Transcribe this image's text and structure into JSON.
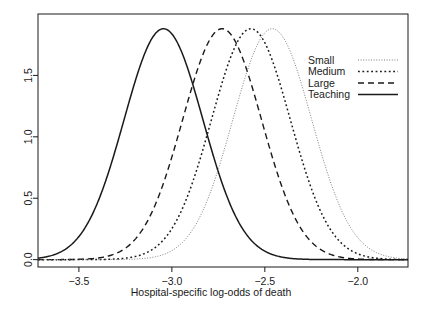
{
  "chart_data": {
    "type": "line",
    "title": "",
    "xlabel": "Hospital-specific log-odds of death",
    "ylabel": "",
    "xlim": [
      -3.72,
      -1.73
    ],
    "ylim": [
      -0.06,
      2.0
    ],
    "xticks": [
      -3.5,
      -3.0,
      -2.5,
      -2.0
    ],
    "xtick_labels": [
      "-3.5",
      "-3.0",
      "-2.5",
      "-2.0"
    ],
    "yticks": [
      0.0,
      0.5,
      1.0,
      1.5
    ],
    "ytick_labels": [
      "0.0",
      "0.5",
      "1.0",
      "1.5"
    ],
    "grid": false,
    "legend_position": "top-right",
    "frame": true,
    "series": [
      {
        "name": "Small",
        "label": "Small",
        "linestyle": "fine-dotted",
        "dash": "1,1.6",
        "width": 0.9,
        "color": "#6f6f6f",
        "mean": -2.46,
        "sd": 0.212,
        "peak": 1.88
      },
      {
        "name": "Medium",
        "label": "Medium",
        "linestyle": "dotted",
        "dash": "1.8,2.6",
        "width": 1.5,
        "color": "#1a1a1a",
        "mean": -2.575,
        "sd": 0.212,
        "peak": 1.88
      },
      {
        "name": "Large",
        "label": "Large",
        "linestyle": "dashed",
        "dash": "6,4",
        "width": 1.4,
        "color": "#1a1a1a",
        "mean": -2.73,
        "sd": 0.212,
        "peak": 1.88
      },
      {
        "name": "Teaching",
        "label": "Teaching",
        "linestyle": "solid",
        "dash": "none",
        "width": 1.5,
        "color": "#1a1a1a",
        "mean": -3.045,
        "sd": 0.212,
        "peak": 1.88
      }
    ]
  },
  "legend": {
    "entries": [
      {
        "label": "Small"
      },
      {
        "label": "Medium"
      },
      {
        "label": "Large"
      },
      {
        "label": "Teaching"
      }
    ]
  },
  "axes": {
    "x_title": "Hospital-specific log-odds of death"
  },
  "colors": {
    "ink": "#1a1a1a",
    "light_ink": "#6f6f6f",
    "background": "#ffffff"
  }
}
